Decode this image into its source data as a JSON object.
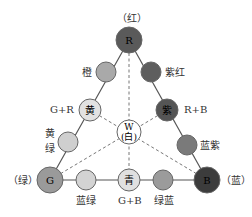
{
  "diagram": {
    "corner_labels": {
      "top": "（红）",
      "left": "（绿）",
      "right": "（蓝）"
    },
    "nodes": [
      {
        "id": "R",
        "text": "R",
        "color": "#5a5a5a",
        "text_color": "#111111",
        "label": ""
      },
      {
        "id": "orange",
        "text": "",
        "color": "#a9a9a9",
        "text_color": "#111111",
        "label": "橙"
      },
      {
        "id": "magenta",
        "text": "",
        "color": "#5e5e5e",
        "text_color": "#111111",
        "label": "紫红"
      },
      {
        "id": "yellow",
        "text": "黄",
        "color": "#e2e2e2",
        "text_color": "#333333",
        "label": "G+R"
      },
      {
        "id": "purple",
        "text": "紫",
        "color": "#555555",
        "text_color": "#222222",
        "label": "R+B"
      },
      {
        "id": "white",
        "text": "W",
        "text2": "(白)",
        "color": "#ffffff",
        "text_color": "#333333",
        "label": ""
      },
      {
        "id": "yellowgreen",
        "text": "",
        "color": "#cfcfcf",
        "text_color": "#111111",
        "label": "黄",
        "label2": "绿"
      },
      {
        "id": "bluepurple",
        "text": "",
        "color": "#7a7a7a",
        "text_color": "#111111",
        "label": "蓝紫"
      },
      {
        "id": "G",
        "text": "G",
        "color": "#9a9a9a",
        "text_color": "#111111",
        "label": ""
      },
      {
        "id": "bluegreen",
        "text": "",
        "color": "#d3d3d3",
        "text_color": "#111111",
        "label": "蓝绿"
      },
      {
        "id": "cyan",
        "text": "青",
        "color": "#e0e0e0",
        "text_color": "#333333",
        "label": "G+B"
      },
      {
        "id": "greenblue",
        "text": "",
        "color": "#9b9b9b",
        "text_color": "#111111",
        "label": "绿蓝"
      },
      {
        "id": "B",
        "text": "B",
        "color": "#3c3c3c",
        "text_color": "#111111",
        "label": ""
      }
    ]
  }
}
